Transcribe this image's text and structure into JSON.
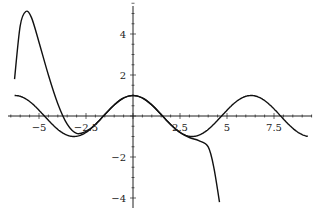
{
  "chart_data": {
    "type": "line",
    "title": "",
    "xlabel": "",
    "ylabel": "",
    "xlim": [
      -6.5,
      9.5
    ],
    "ylim": [
      -4.2,
      5.6
    ],
    "grid": false,
    "legend": null,
    "x_ticks": [
      {
        "value": -5,
        "label": "-5"
      },
      {
        "value": -2.5,
        "label": "-2.5"
      },
      {
        "value": 2.5,
        "label": "2.5"
      },
      {
        "value": 5,
        "label": "5"
      },
      {
        "value": 7.5,
        "label": "7.5"
      }
    ],
    "y_ticks": [
      {
        "value": 4,
        "label": "4"
      },
      {
        "value": 2,
        "label": "2"
      },
      {
        "value": -2,
        "label": "-2"
      },
      {
        "value": -4,
        "label": "-4"
      }
    ],
    "series": [
      {
        "name": "cos(x)",
        "x": [
          -6.3,
          -5.5,
          -4.7,
          -3.9,
          -3.14,
          -2.4,
          -1.57,
          -0.8,
          0,
          0.8,
          1.57,
          2.4,
          3.14,
          3.9,
          4.71,
          5.5,
          6.28,
          7.1,
          7.85,
          8.6,
          9.3
        ],
        "values": [
          1.0,
          0.71,
          0.0,
          -0.73,
          -1.0,
          -0.74,
          0.0,
          0.7,
          1.0,
          0.7,
          0.0,
          -0.74,
          -1.0,
          -0.73,
          0.0,
          0.71,
          1.0,
          0.68,
          0.0,
          -0.68,
          -0.99
        ]
      },
      {
        "name": "polynomial approximation",
        "x": [
          -6.3,
          -6.0,
          -5.7,
          -5.4,
          -5.0,
          -4.5,
          -4.0,
          -3.5,
          -3.0,
          -2.5,
          -2.0,
          -1.5,
          -1.0,
          -0.5,
          0,
          0.5,
          1.0,
          1.5,
          2.0,
          2.5,
          3.0,
          3.5,
          4.0,
          4.3,
          4.6
        ],
        "values": [
          1.8,
          4.4,
          5.1,
          4.8,
          3.6,
          2.0,
          0.6,
          -0.4,
          -0.85,
          -0.75,
          -0.42,
          0.07,
          0.54,
          0.88,
          1.0,
          0.88,
          0.54,
          0.07,
          -0.42,
          -0.8,
          -1.05,
          -1.2,
          -1.5,
          -2.5,
          -4.2
        ]
      }
    ]
  }
}
